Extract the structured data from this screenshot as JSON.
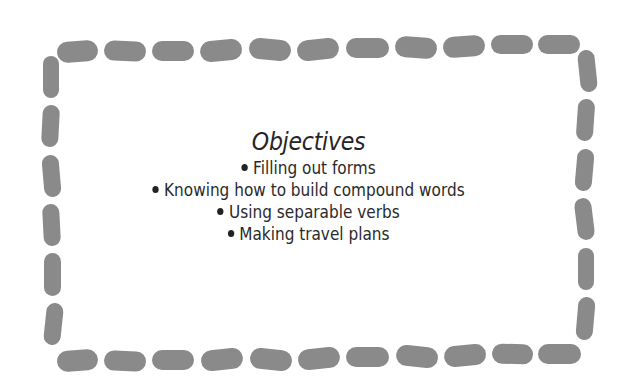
{
  "frame": {
    "border_style": "dashed-rounded",
    "dash_color": "#8a8a8a",
    "top": [
      {
        "x": 57,
        "y": 41,
        "w": 41,
        "h": 21,
        "rot": -4
      },
      {
        "x": 104,
        "y": 41,
        "w": 42,
        "h": 20,
        "rot": 2
      },
      {
        "x": 152,
        "y": 41,
        "w": 42,
        "h": 20,
        "rot": 0
      },
      {
        "x": 200,
        "y": 40,
        "w": 42,
        "h": 21,
        "rot": -5
      },
      {
        "x": 249,
        "y": 39,
        "w": 42,
        "h": 21,
        "rot": 5
      },
      {
        "x": 297,
        "y": 39,
        "w": 42,
        "h": 21,
        "rot": -6
      },
      {
        "x": 346,
        "y": 38,
        "w": 43,
        "h": 20,
        "rot": 0
      },
      {
        "x": 395,
        "y": 37,
        "w": 42,
        "h": 21,
        "rot": 4
      },
      {
        "x": 443,
        "y": 36,
        "w": 42,
        "h": 21,
        "rot": -4
      },
      {
        "x": 491,
        "y": 35,
        "w": 42,
        "h": 19,
        "rot": 0
      },
      {
        "x": 538,
        "y": 35,
        "w": 42,
        "h": 19,
        "rot": 0
      }
    ],
    "bottom": [
      {
        "x": 57,
        "y": 350,
        "w": 41,
        "h": 21,
        "rot": -4
      },
      {
        "x": 104,
        "y": 351,
        "w": 42,
        "h": 20,
        "rot": 2
      },
      {
        "x": 152,
        "y": 350,
        "w": 42,
        "h": 20,
        "rot": 0
      },
      {
        "x": 201,
        "y": 349,
        "w": 42,
        "h": 21,
        "rot": -6
      },
      {
        "x": 250,
        "y": 349,
        "w": 42,
        "h": 21,
        "rot": 6
      },
      {
        "x": 298,
        "y": 348,
        "w": 42,
        "h": 21,
        "rot": -6
      },
      {
        "x": 346,
        "y": 347,
        "w": 43,
        "h": 20,
        "rot": 0
      },
      {
        "x": 396,
        "y": 346,
        "w": 42,
        "h": 21,
        "rot": 6
      },
      {
        "x": 444,
        "y": 345,
        "w": 42,
        "h": 21,
        "rot": -5
      },
      {
        "x": 492,
        "y": 344,
        "w": 41,
        "h": 20,
        "rot": 2
      },
      {
        "x": 538,
        "y": 344,
        "w": 43,
        "h": 20,
        "rot": 0
      }
    ],
    "left": [
      {
        "x": 43,
        "y": 56,
        "w": 16,
        "h": 42,
        "rot": 0
      },
      {
        "x": 42,
        "y": 105,
        "w": 17,
        "h": 42,
        "rot": 3
      },
      {
        "x": 43,
        "y": 155,
        "w": 17,
        "h": 42,
        "rot": -5
      },
      {
        "x": 43,
        "y": 204,
        "w": 17,
        "h": 42,
        "rot": -3
      },
      {
        "x": 44,
        "y": 253,
        "w": 17,
        "h": 43,
        "rot": 0
      },
      {
        "x": 45,
        "y": 303,
        "w": 17,
        "h": 42,
        "rot": 6
      }
    ],
    "right": [
      {
        "x": 579,
        "y": 50,
        "w": 17,
        "h": 42,
        "rot": -6
      },
      {
        "x": 577,
        "y": 99,
        "w": 17,
        "h": 42,
        "rot": 4
      },
      {
        "x": 576,
        "y": 149,
        "w": 17,
        "h": 42,
        "rot": 5
      },
      {
        "x": 576,
        "y": 198,
        "w": 17,
        "h": 42,
        "rot": -7
      },
      {
        "x": 578,
        "y": 248,
        "w": 16,
        "h": 42,
        "rot": 0
      },
      {
        "x": 577,
        "y": 297,
        "w": 17,
        "h": 43,
        "rot": 5
      }
    ]
  },
  "heading": "Objectives",
  "objectives": [
    "Filling out  forms",
    "Knowing how to build compound words",
    "Using separable verbs",
    "Making travel plans"
  ]
}
